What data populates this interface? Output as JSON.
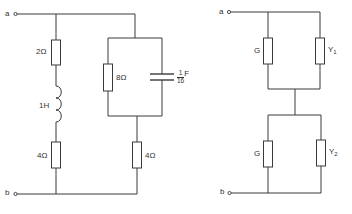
{
  "left_circuit": {
    "terminal_top": "a",
    "terminal_bottom": "b",
    "series_branch": {
      "resistor_top": "2Ω",
      "inductor": "1H",
      "resistor_bottom": "4Ω"
    },
    "parallel_branch": {
      "resistor": "8Ω",
      "capacitor": {
        "numerator": "1",
        "denominator": "16",
        "unit": "F"
      },
      "series_resistor": "4Ω"
    }
  },
  "right_circuit": {
    "terminal_top": "a",
    "terminal_bottom": "b",
    "upper_pair": {
      "left": "G",
      "right_main": "Y",
      "right_sub": "1"
    },
    "lower_pair": {
      "left": "G",
      "right_main": "Y",
      "right_sub": "2"
    }
  },
  "colors": {
    "line": "#3a3a3a",
    "text": "#333333",
    "background": "#ffffff"
  }
}
